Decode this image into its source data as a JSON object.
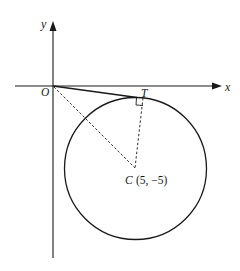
{
  "diagram": {
    "title": "",
    "axes": {
      "x_label": "x",
      "y_label": "y",
      "origin_label": "O"
    },
    "points": {
      "origin": {
        "label": "O"
      },
      "tangent_point": {
        "label": "T"
      },
      "center": {
        "label": "C",
        "coords": "(5, −5)"
      }
    },
    "elements": [
      {
        "type": "axis",
        "name": "x-axis",
        "arrow": true
      },
      {
        "type": "axis",
        "name": "y-axis",
        "arrow": true
      },
      {
        "type": "circle",
        "center": "C (5, −5)"
      },
      {
        "type": "segment",
        "from": "O",
        "to": "T",
        "style": "solid",
        "role": "tangent"
      },
      {
        "type": "segment",
        "from": "O",
        "to": "C",
        "style": "dashed"
      },
      {
        "type": "segment",
        "from": "T",
        "to": "C",
        "style": "dashed",
        "role": "radius"
      },
      {
        "type": "right-angle-marker",
        "at": "T"
      }
    ],
    "colors": {
      "line": "#1a1a1a",
      "background": "#ffffff"
    }
  }
}
